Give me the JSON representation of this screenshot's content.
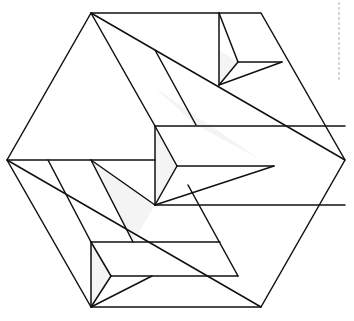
{
  "diagram": {
    "type": "geometric-line-figure",
    "colors": {
      "stroke": "#111111",
      "background": "#ffffff",
      "shade": "#f4f4f4",
      "dash": "#b0b0b0"
    },
    "hexagon": [
      [
        91,
        13
      ],
      [
        261,
        13
      ],
      [
        345,
        160
      ],
      [
        261,
        307
      ],
      [
        91,
        307
      ],
      [
        7,
        160
      ]
    ],
    "shaded_regions": [
      [
        [
          155,
          88
        ],
        [
          261,
          160
        ],
        [
          196,
          125
        ]
      ],
      [
        [
          219,
          50
        ],
        [
          238,
          62
        ],
        [
          219,
          85
        ]
      ],
      [
        [
          155,
          126
        ],
        [
          177,
          166
        ],
        [
          155,
          205
        ]
      ],
      [
        [
          91,
          242
        ],
        [
          111,
          276
        ],
        [
          91,
          307
        ]
      ],
      [
        [
          91,
          160
        ],
        [
          155,
          205
        ],
        [
          133,
          242
        ],
        [
          110,
          200
        ]
      ]
    ],
    "lines": [
      [
        [
          91,
          13
        ],
        [
          345,
          160
        ]
      ],
      [
        [
          91,
          13
        ],
        [
          155,
          126
        ]
      ],
      [
        [
          219,
          13
        ],
        [
          219,
          85
        ]
      ],
      [
        [
          219,
          13
        ],
        [
          238,
          62
        ]
      ],
      [
        [
          238,
          62
        ],
        [
          282,
          62
        ]
      ],
      [
        [
          238,
          62
        ],
        [
          219,
          85
        ]
      ],
      [
        [
          219,
          85
        ],
        [
          282,
          62
        ]
      ],
      [
        [
          155,
          50
        ],
        [
          196,
          125
        ]
      ],
      [
        [
          155,
          126
        ],
        [
          345,
          126
        ]
      ],
      [
        [
          155,
          126
        ],
        [
          155,
          205
        ]
      ],
      [
        [
          155,
          126
        ],
        [
          177,
          166
        ]
      ],
      [
        [
          177,
          166
        ],
        [
          155,
          205
        ]
      ],
      [
        [
          177,
          166
        ],
        [
          274,
          166
        ]
      ],
      [
        [
          155,
          205
        ],
        [
          274,
          166
        ]
      ],
      [
        [
          7,
          160
        ],
        [
          155,
          160
        ]
      ],
      [
        [
          7,
          160
        ],
        [
          261,
          307
        ]
      ],
      [
        [
          48,
          160
        ],
        [
          91,
          242
        ]
      ],
      [
        [
          91,
          160
        ],
        [
          133,
          242
        ]
      ],
      [
        [
          91,
          160
        ],
        [
          155,
          205
        ]
      ],
      [
        [
          155,
          205
        ],
        [
          345,
          205
        ]
      ],
      [
        [
          91,
          242
        ],
        [
          220,
          242
        ]
      ],
      [
        [
          91,
          242
        ],
        [
          91,
          307
        ]
      ],
      [
        [
          91,
          242
        ],
        [
          111,
          276
        ]
      ],
      [
        [
          111,
          276
        ],
        [
          91,
          307
        ]
      ],
      [
        [
          111,
          276
        ],
        [
          238,
          276
        ]
      ],
      [
        [
          91,
          307
        ],
        [
          152,
          276
        ]
      ],
      [
        [
          188,
          185
        ],
        [
          238,
          276
        ]
      ]
    ],
    "dashed_guide": {
      "x": 339,
      "y1": 2,
      "y2": 80
    }
  }
}
